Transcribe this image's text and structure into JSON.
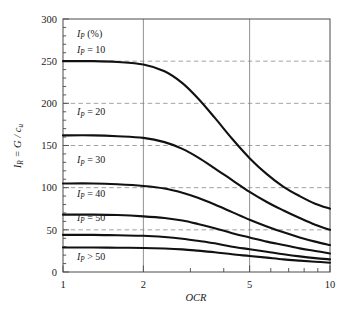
{
  "chart_data": {
    "type": "line",
    "title": "",
    "xlabel": "OCR",
    "ylabel": "I_R = G / c_u",
    "xscale": "log",
    "xlim": [
      1,
      10
    ],
    "ylim": [
      0,
      300
    ],
    "xticks": [
      1,
      2,
      5,
      10
    ],
    "xtick_labels": [
      "1",
      "2",
      "5",
      "10"
    ],
    "yticks": [
      0,
      50,
      100,
      150,
      200,
      250,
      300
    ],
    "ytick_labels": [
      "0",
      "50",
      "100",
      "150",
      "200",
      "250",
      "300"
    ],
    "grid": "horizontal dashed at every 50; vertical solid at OCR = 2 and 5",
    "legend_position": "inline labels at left of each curve",
    "annotations": [
      "I_P (%)"
    ],
    "series": [
      {
        "name": "I_P = 10",
        "label": "I_P = 10",
        "x": [
          1,
          1.3,
          1.6,
          2,
          2.4,
          2.8,
          3.2,
          3.7,
          4.3,
          5,
          5.8,
          6.7,
          7.7,
          8.8,
          10
        ],
        "values": [
          250,
          250,
          249,
          246,
          238,
          224,
          206,
          183,
          158,
          135,
          116,
          101,
          90,
          81,
          75
        ]
      },
      {
        "name": "I_P = 20",
        "label": "I_P = 20",
        "x": [
          1,
          1.3,
          1.6,
          2,
          2.4,
          2.8,
          3.2,
          3.7,
          4.3,
          5,
          5.8,
          6.7,
          7.7,
          8.8,
          10
        ],
        "values": [
          162,
          162,
          161,
          159,
          154,
          146,
          136,
          123,
          109,
          95,
          83,
          73,
          64,
          56,
          50
        ]
      },
      {
        "name": "I_P = 30",
        "label": "I_P = 30",
        "x": [
          1,
          1.3,
          1.6,
          2,
          2.4,
          2.8,
          3.2,
          3.7,
          4.3,
          5,
          5.8,
          6.7,
          7.7,
          8.8,
          10
        ],
        "values": [
          105,
          105,
          104,
          102,
          99,
          94,
          88,
          80,
          71,
          62,
          54,
          47,
          41,
          36,
          32
        ]
      },
      {
        "name": "I_P = 40",
        "label": "I_P = 40",
        "x": [
          1,
          1.3,
          1.6,
          2,
          2.4,
          2.8,
          3.2,
          3.7,
          4.3,
          5,
          5.8,
          6.7,
          7.7,
          8.8,
          10
        ],
        "values": [
          68,
          68,
          67.5,
          66,
          64,
          61,
          57,
          52,
          46,
          41,
          36,
          32,
          28,
          25,
          22
        ]
      },
      {
        "name": "I_P = 50",
        "label": "I_P = 50",
        "x": [
          1,
          1.3,
          1.6,
          2,
          2.4,
          2.8,
          3.2,
          3.7,
          4.3,
          5,
          5.8,
          6.7,
          7.7,
          8.8,
          10
        ],
        "values": [
          44,
          44,
          43.5,
          43,
          41.5,
          39.5,
          37,
          34,
          30,
          27,
          24,
          21,
          18.5,
          16.5,
          15
        ]
      },
      {
        "name": "I_P > 50",
        "label": "I_P > 50",
        "x": [
          1,
          1.3,
          1.6,
          2,
          2.4,
          2.8,
          3.2,
          3.7,
          4.3,
          5,
          5.8,
          6.7,
          7.7,
          8.8,
          10
        ],
        "values": [
          29,
          29,
          28.8,
          28.5,
          27.8,
          26.8,
          25.3,
          23.4,
          21,
          19,
          17,
          15,
          13.5,
          12.2,
          11
        ]
      }
    ]
  },
  "axis": {
    "x_title": "OCR",
    "y_title_parts": {
      "i": "I",
      "sub_r": "R",
      "eq": " = ",
      "g": "G",
      "slash": " / ",
      "c": "c",
      "sub_u": "u"
    }
  },
  "labels": {
    "header": {
      "sym": "I",
      "sub": "P",
      "rest": " (%)"
    },
    "curves": [
      {
        "sym": "I",
        "sub": "P",
        "rest": " = 10"
      },
      {
        "sym": "I",
        "sub": "P",
        "rest": " = 20"
      },
      {
        "sym": "I",
        "sub": "P",
        "rest": " = 30"
      },
      {
        "sym": "I",
        "sub": "P",
        "rest": " = 40"
      },
      {
        "sym": "I",
        "sub": "P",
        "rest": " = 50"
      },
      {
        "sym": "I",
        "sub": "P",
        "rest": " > 50"
      }
    ]
  },
  "colors": {
    "curve": "#111111",
    "grid_dashed": "#8a8a8a",
    "grid_solid": "#7d7d7d",
    "frame": "#4a4a4a",
    "background": "#ffffff"
  }
}
